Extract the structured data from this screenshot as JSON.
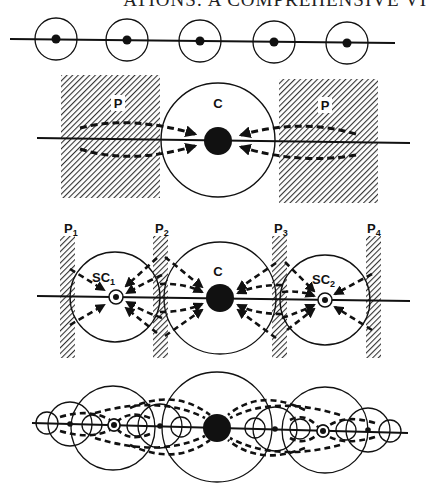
{
  "header": {
    "text": "ATIONS: A COMPREHENSIVE VI"
  },
  "colors": {
    "ink": "#111111",
    "paper": "#ffffff",
    "hatch": "#333333"
  },
  "panels": [
    {
      "id": "panel-1",
      "description": "Evenly spaced settlements along a line",
      "labels": []
    },
    {
      "id": "panel-2",
      "description": "Central place with periphery flows",
      "labels": {
        "left_periphery": "P",
        "center": "C",
        "right_periphery": "P"
      }
    },
    {
      "id": "panel-3",
      "description": "Center with sub-centers and peripheries",
      "labels": {
        "p1": "P",
        "p1_sub": "1",
        "p2": "P",
        "p2_sub": "2",
        "p3": "P",
        "p3_sub": "3",
        "p4": "P",
        "p4_sub": "4",
        "sc1": "SC",
        "sc1_sub": "1",
        "center": "C",
        "sc2": "SC",
        "sc2_sub": "2"
      }
    },
    {
      "id": "panel-4",
      "description": "Hierarchical nested system of centers",
      "labels": []
    }
  ]
}
